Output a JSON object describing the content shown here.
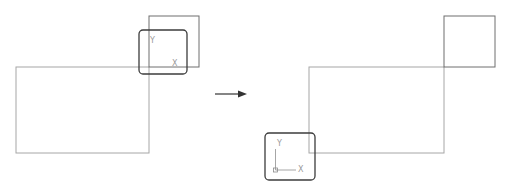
{
  "diagram": {
    "colors": {
      "geometry_line": "#a6a6a6",
      "square_line": "#6e6e6e",
      "ucs_frame": "#3c3c3c",
      "arrow": "#333333",
      "axis_label": "#9a9a9a"
    },
    "before": {
      "ucs_icon": {
        "y_label": "Y",
        "x_label": "X"
      }
    },
    "after": {
      "ucs_icon": {
        "y_label": "Y",
        "x_label": "X"
      }
    },
    "transition_arrow": {
      "direction": "right"
    }
  }
}
